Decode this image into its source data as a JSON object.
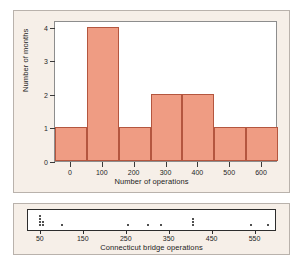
{
  "chart_data": [
    {
      "type": "bar",
      "name": "histogram-number-of-operations",
      "title": "",
      "xlabel": "Number of operations",
      "ylabel": "Number of months",
      "categories": [
        "-50 to 50",
        "50 to 150",
        "150 to 250",
        "250 to 350",
        "350 to 450",
        "450 to 550",
        "550 to 650"
      ],
      "bin_edges": [
        -50,
        50,
        150,
        250,
        350,
        450,
        550,
        650
      ],
      "values": [
        1,
        4,
        1,
        2,
        2,
        1,
        1
      ],
      "xlim": [
        -50,
        650
      ],
      "ylim": [
        0,
        4.2
      ],
      "xticks": [
        0,
        100,
        200,
        300,
        400,
        500,
        600
      ],
      "xtick_labels": [
        "0",
        "100",
        "200",
        "300",
        "400",
        "500",
        "600"
      ],
      "yticks": [
        0,
        1,
        2,
        3,
        4
      ],
      "ytick_labels": [
        "0",
        "1",
        "2",
        "3",
        "4"
      ],
      "grid": false,
      "legend": "none",
      "bar_fill_color": "#ef9c83",
      "bar_edge_color": "#b4563f"
    },
    {
      "type": "scatter",
      "name": "dotplot-connecticut-bridge-operations",
      "title": "",
      "xlabel": "Connecticut bridge operations",
      "ylabel": "",
      "xlim": [
        20,
        600
      ],
      "xticks": [
        50,
        150,
        250,
        350,
        450,
        550
      ],
      "xtick_labels": [
        "50",
        "150",
        "250",
        "350",
        "450",
        "550"
      ],
      "grid": false,
      "legend": "none",
      "dot_color": "#161616",
      "stacks": [
        {
          "x": 48,
          "count": 4
        },
        {
          "x": 55,
          "count": 2
        },
        {
          "x": 100,
          "count": 1
        },
        {
          "x": 252,
          "count": 1
        },
        {
          "x": 300,
          "count": 1
        },
        {
          "x": 330,
          "count": 1
        },
        {
          "x": 405,
          "count": 3
        },
        {
          "x": 540,
          "count": 1
        },
        {
          "x": 578,
          "count": 1
        }
      ]
    }
  ],
  "histogram": {
    "x_axis_title": "Number of operations",
    "y_axis_title": "Number of months"
  },
  "dotplot": {
    "axis_title": "Connecticut bridge operations"
  },
  "colors": {
    "panel_background": "#f6efe8",
    "plot_background": "#ffffff",
    "bar_fill": "#ef9c83",
    "bar_edge": "#b4563f",
    "axis": "#2d2d2d",
    "page_background": "#ffffff"
  }
}
